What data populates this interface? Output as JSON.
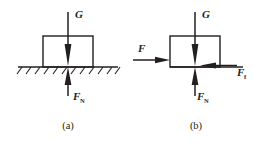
{
  "figure": {
    "type": "free-body-diagram",
    "colors": {
      "ink": "#231f20",
      "background": "#ffffff"
    },
    "panels": [
      {
        "id": "a",
        "caption": "(a)",
        "description": "Block resting on hatched ground, gravity and normal force only",
        "ground": {
          "hatched": true,
          "x_start": 18,
          "x_end": 118,
          "y": 67
        },
        "block": {
          "x": 43,
          "y": 36,
          "width": 50,
          "height": 31
        },
        "forces": [
          {
            "name": "weight",
            "label": "G",
            "subscript": "",
            "direction": "down",
            "label_x": 75,
            "label_y": 18,
            "tail_x": 68,
            "tail_y": 12,
            "tip_x": 68,
            "tip_y": 66
          },
          {
            "name": "normal-force",
            "label": "F",
            "subscript": "N",
            "direction": "up",
            "label_x": 73,
            "label_y": 100,
            "tail_x": 68,
            "tail_y": 96,
            "tip_x": 68,
            "tip_y": 67
          }
        ]
      },
      {
        "id": "b",
        "caption": "(b)",
        "description": "Block pushed horizontally, gravity, applied force, friction and normal force",
        "ground": {
          "hatched": false,
          "x_start": 170,
          "x_end": 240,
          "y": 67
        },
        "block": {
          "x": 170,
          "y": 36,
          "width": 50,
          "height": 31
        },
        "forces": [
          {
            "name": "weight",
            "label": "G",
            "subscript": "",
            "direction": "down",
            "label_x": 202,
            "label_y": 18,
            "tail_x": 195,
            "tail_y": 12,
            "tip_x": 195,
            "tip_y": 66
          },
          {
            "name": "applied-force",
            "label": "F",
            "subscript": "",
            "direction": "right",
            "label_x": 141,
            "label_y": 52,
            "tail_x": 133,
            "tail_y": 60,
            "tip_x": 170,
            "tip_y": 60
          },
          {
            "name": "friction-force",
            "label": "F",
            "subscript": "f",
            "direction": "left",
            "label_x": 240,
            "label_y": 75,
            "tail_x": 237,
            "tail_y": 66,
            "tip_x": 200,
            "tip_y": 66
          },
          {
            "name": "normal-force",
            "label": "F",
            "subscript": "N",
            "direction": "up",
            "label_x": 200,
            "label_y": 100,
            "tail_x": 195,
            "tail_y": 96,
            "tip_x": 195,
            "tip_y": 67
          }
        ]
      }
    ]
  }
}
